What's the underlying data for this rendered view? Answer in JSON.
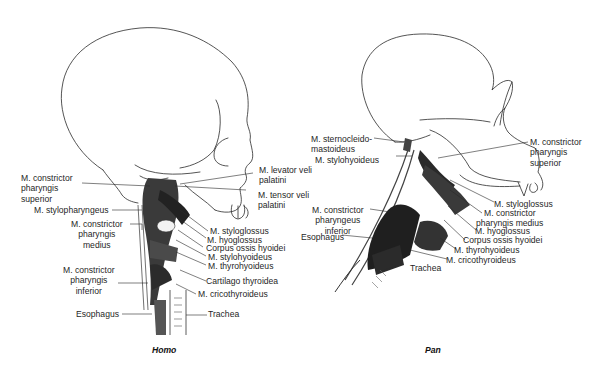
{
  "figure": {
    "panels": [
      {
        "caption": "Homo",
        "labels": {
          "constrictor_superior": [
            "M. constrictor",
            "pharyngis",
            "superior"
          ],
          "stylopharyngeus": "M. stylopharyngeus",
          "constrictor_medius": [
            "M. constrictor",
            "pharyngis",
            "medius"
          ],
          "constrictor_inferior": [
            "M. constrictor",
            "pharyngis",
            "inferior"
          ],
          "esophagus": "Esophagus",
          "levator_veli": [
            "M. levator veli",
            "palatini"
          ],
          "tensor_veli": [
            "M. tensor veli",
            "palatini"
          ],
          "styloglossus": "M. styloglossus",
          "hyoglossus": "M. hyoglossus",
          "corpus_hyoidei": "Corpus ossis hyoidei",
          "stylohyoideus": "M. stylohyoideus",
          "thyrohyoideus": "M. thyrohyoideus",
          "cartilago_thyroidea": "Cartilago thyroidea",
          "cricothyroideus": "M. cricothyroideus",
          "trachea": "Trachea"
        }
      },
      {
        "caption": "Pan",
        "labels": {
          "sternocleidomastoideus": [
            "M. sternocleido-",
            "mastoideus"
          ],
          "stylohyoideus": "M. stylohyoideus",
          "constrictor_inferior": [
            "M. constrictor",
            "pharyngeus",
            "inferior"
          ],
          "esophagus": "Esophagus",
          "trachea": "Trachea",
          "constrictor_superior": [
            "M. constrictor",
            "pharyngis",
            "superior"
          ],
          "styloglossus": "M. styloglossus",
          "constrictor_medius": [
            "M. constrictor",
            "pharyngis medius"
          ],
          "hyoglossus": "M. hyoglossus",
          "corpus_hyoidei": "Corpus ossis hyoidei",
          "thyrohyoideus": "M. thyrohyoideus",
          "cricothyroideus": "M. cricothyroideus"
        }
      }
    ]
  }
}
